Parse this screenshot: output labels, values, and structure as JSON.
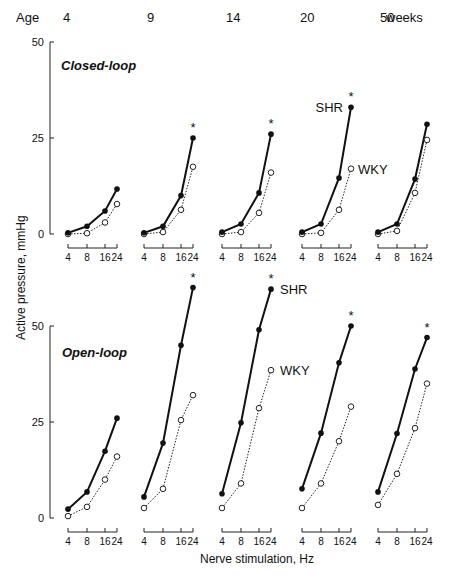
{
  "chart_data": {
    "type": "line",
    "title": "",
    "xlabel": "Nerve stimulation, Hz",
    "ylabel": "Active pressure, mmHg",
    "age_label": "Age",
    "age_unit": "weeks",
    "ages": [
      "4",
      "9",
      "14",
      "20",
      "50"
    ],
    "x": [
      4,
      8,
      16,
      24
    ],
    "x_tick_labels": [
      "4",
      "8",
      "16",
      "24"
    ],
    "legend": [
      "SHR",
      "WKY"
    ],
    "series_styles": {
      "SHR": {
        "line": "solid",
        "marker": "filled-circle"
      },
      "WKY": {
        "line": "dotted",
        "marker": "open-circle"
      }
    },
    "panels": [
      {
        "condition": "Closed-loop",
        "ylim": [
          0,
          50
        ],
        "y_ticks": [
          "0",
          "25",
          "50"
        ],
        "groups": [
          {
            "age": "4",
            "SHR": [
              0.3,
              2.0,
              6.0,
              11.7
            ],
            "WKY": [
              0.0,
              0.2,
              3.0,
              7.8
            ],
            "significant": false
          },
          {
            "age": "9",
            "SHR": [
              0.3,
              2.0,
              10.0,
              25.0
            ],
            "WKY": [
              0.0,
              0.5,
              6.3,
              17.5
            ],
            "significant": true
          },
          {
            "age": "14",
            "SHR": [
              0.5,
              2.6,
              10.7,
              26.0
            ],
            "WKY": [
              0.0,
              0.5,
              5.5,
              16.0
            ],
            "significant": true
          },
          {
            "age": "20",
            "SHR": [
              0.5,
              2.6,
              14.6,
              33.0
            ],
            "WKY": [
              0.0,
              0.3,
              6.3,
              17.0
            ],
            "significant": true
          },
          {
            "age": "50",
            "SHR": [
              0.5,
              2.6,
              14.3,
              28.6
            ],
            "WKY": [
              0.0,
              0.8,
              10.7,
              24.5
            ],
            "significant": false
          }
        ],
        "annotations": [
          {
            "text": "SHR",
            "group": 3
          },
          {
            "text": "WKY",
            "group": 3
          }
        ]
      },
      {
        "condition": "Open-loop",
        "ylim": [
          0,
          50
        ],
        "y_ticks": [
          "0",
          "25",
          "50"
        ],
        "groups": [
          {
            "age": "4",
            "SHR": [
              2.3,
              6.8,
              17.4,
              26.0
            ],
            "WKY": [
              0.5,
              2.9,
              10.0,
              16.0
            ],
            "significant": false
          },
          {
            "age": "9",
            "SHR": [
              5.5,
              19.5,
              45.0,
              60.0
            ],
            "WKY": [
              2.6,
              7.6,
              25.5,
              32.0
            ],
            "significant": true
          },
          {
            "age": "14",
            "SHR": [
              6.3,
              24.8,
              49.0,
              59.6
            ],
            "WKY": [
              2.6,
              9.0,
              28.6,
              38.5
            ],
            "significant": true
          },
          {
            "age": "20",
            "SHR": [
              7.6,
              22.1,
              40.4,
              50.0
            ],
            "WKY": [
              2.6,
              9.0,
              20.0,
              29.0
            ],
            "significant": true
          },
          {
            "age": "50",
            "SHR": [
              6.8,
              22.0,
              38.8,
              47.0
            ],
            "WKY": [
              3.4,
              11.5,
              23.4,
              35.0
            ],
            "significant": true
          }
        ],
        "annotations": [
          {
            "text": "SHR",
            "group": 2
          },
          {
            "text": "WKY",
            "group": 2
          }
        ]
      }
    ],
    "significance_marker": "*",
    "grid": false
  },
  "labels": {
    "age": "Age",
    "weeks": "weeks",
    "closed_loop": "Closed-loop",
    "open_loop": "Open-loop",
    "ylabel": "Active pressure, mmHg",
    "xlabel": "Nerve stimulation, Hz",
    "shr": "SHR",
    "wky": "WKY",
    "star": "*"
  }
}
